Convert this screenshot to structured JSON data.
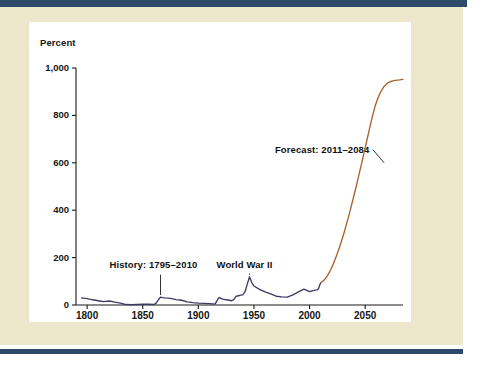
{
  "page": {
    "background_color": "#ece7cd",
    "rule_color": "#2d4a6b",
    "panel_color": "#ffffff"
  },
  "chart_data": {
    "type": "line",
    "title": "",
    "subtitle": "",
    "xlabel": "",
    "ylabel": "Percent",
    "xlim": [
      1790,
      2084
    ],
    "ylim": [
      0,
      1000
    ],
    "grid": false,
    "legend_position": "none",
    "xticks": [
      1800,
      1850,
      1900,
      1950,
      2000,
      2050
    ],
    "xtick_labels": [
      "1800",
      "1850",
      "1900",
      "1950",
      "2000",
      "2050"
    ],
    "yticks": [
      0,
      200,
      400,
      600,
      800,
      1000
    ],
    "ytick_labels": [
      "0",
      "200",
      "400",
      "600",
      "800",
      "1,000"
    ],
    "annotations": [
      {
        "id": "history",
        "text": "History: 1795–2010",
        "x": 1866,
        "y": 140
      },
      {
        "id": "wwii",
        "text": "World War II",
        "x": 1946,
        "y": 140
      },
      {
        "id": "forecast",
        "text": "Forecast: 2011–2084",
        "x": 2062,
        "y": 640
      }
    ],
    "series": [
      {
        "name": "History: 1795–2010",
        "color": "#3d3a63",
        "x": [
          1795,
          1800,
          1805,
          1810,
          1815,
          1820,
          1825,
          1830,
          1835,
          1840,
          1845,
          1850,
          1855,
          1860,
          1862,
          1864,
          1866,
          1868,
          1870,
          1875,
          1880,
          1885,
          1890,
          1895,
          1900,
          1905,
          1910,
          1915,
          1918,
          1919,
          1920,
          1922,
          1925,
          1928,
          1930,
          1932,
          1934,
          1936,
          1938,
          1940,
          1942,
          1944,
          1946,
          1948,
          1950,
          1955,
          1960,
          1965,
          1970,
          1975,
          1980,
          1985,
          1990,
          1995,
          2000,
          2003,
          2005,
          2007,
          2008,
          2009,
          2010
        ],
        "values": [
          30,
          27,
          22,
          18,
          14,
          17,
          12,
          8,
          2,
          1,
          2,
          3,
          3,
          2,
          8,
          22,
          33,
          31,
          30,
          28,
          23,
          20,
          13,
          10,
          8,
          7,
          6,
          4,
          28,
          32,
          28,
          25,
          22,
          20,
          18,
          24,
          37,
          39,
          42,
          43,
          56,
          88,
          119,
          95,
          80,
          66,
          55,
          47,
          37,
          34,
          33,
          43,
          55,
          67,
          56,
          61,
          63,
          64,
          68,
          82,
          94
        ],
        "annotation_points": [
          {
            "label": "1790s debt",
            "year": 1795,
            "value": 30
          },
          {
            "label": "Civil War peak",
            "year": 1866,
            "value": 33
          },
          {
            "label": "World War I peak",
            "year": 1919,
            "value": 32
          },
          {
            "label": "World War II peak",
            "year": 1946,
            "value": 119
          },
          {
            "label": "2010 end of history",
            "year": 2010,
            "value": 94
          }
        ]
      },
      {
        "name": "Forecast: 2011–2084",
        "color": "#a8622c",
        "x": [
          2010,
          2011,
          2013,
          2015,
          2017,
          2019,
          2021,
          2023,
          2025,
          2027,
          2029,
          2031,
          2033,
          2035,
          2037,
          2039,
          2041,
          2043,
          2045,
          2047,
          2049,
          2051,
          2053,
          2055,
          2057,
          2059,
          2061,
          2063,
          2065,
          2067,
          2069,
          2071,
          2073,
          2075,
          2077,
          2079,
          2081,
          2084
        ],
        "values": [
          94,
          97,
          105,
          116,
          131,
          149,
          170,
          193,
          218,
          245,
          274,
          305,
          338,
          372,
          408,
          445,
          483,
          522,
          562,
          602,
          643,
          684,
          725,
          766,
          805,
          840,
          868,
          890,
          908,
          922,
          932,
          939,
          943,
          946,
          948,
          949,
          950,
          952
        ],
        "annotation_points": [
          {
            "label": "Forecast start 2011",
            "year": 2011,
            "value": 97
          },
          {
            "label": "Forecast end 2084",
            "year": 2084,
            "value": 952
          }
        ]
      }
    ]
  }
}
